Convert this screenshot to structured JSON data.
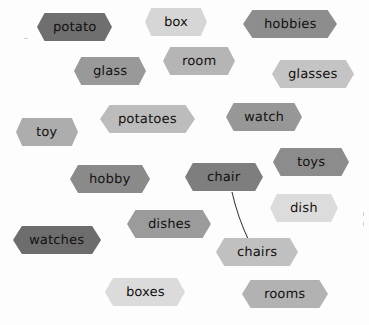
{
  "diagram": {
    "type": "node-graph",
    "title": "",
    "background_color": "#fdfdfd",
    "node_shape": "hexagon",
    "nodes": [
      {
        "id": "potato",
        "label": "potato",
        "color": "#6f6f6f",
        "x": 37,
        "y": 13,
        "w": 75,
        "h": 28
      },
      {
        "id": "box",
        "label": "box",
        "color": "#d6d6d6",
        "x": 145,
        "y": 8,
        "w": 62,
        "h": 28
      },
      {
        "id": "hobbies",
        "label": "hobbies",
        "color": "#8d8d8d",
        "x": 243,
        "y": 10,
        "w": 94,
        "h": 28
      },
      {
        "id": "glass",
        "label": "glass",
        "color": "#999999",
        "x": 74,
        "y": 57,
        "w": 72,
        "h": 28
      },
      {
        "id": "room",
        "label": "room",
        "color": "#b5b5b5",
        "x": 163,
        "y": 47,
        "w": 72,
        "h": 28
      },
      {
        "id": "glasses",
        "label": "glasses",
        "color": "#c4c4c4",
        "x": 272,
        "y": 60,
        "w": 82,
        "h": 28
      },
      {
        "id": "potatoes",
        "label": "potatoes",
        "color": "#bcbcbc",
        "x": 100,
        "y": 105,
        "w": 95,
        "h": 28
      },
      {
        "id": "watch",
        "label": "watch",
        "color": "#979797",
        "x": 226,
        "y": 103,
        "w": 76,
        "h": 28
      },
      {
        "id": "toy",
        "label": "toy",
        "color": "#adadad",
        "x": 16,
        "y": 118,
        "w": 62,
        "h": 28
      },
      {
        "id": "toys",
        "label": "toys",
        "color": "#8c8c8c",
        "x": 273,
        "y": 148,
        "w": 76,
        "h": 28
      },
      {
        "id": "hobby",
        "label": "hobby",
        "color": "#8a8a8a",
        "x": 70,
        "y": 165,
        "w": 80,
        "h": 28
      },
      {
        "id": "chair",
        "label": "chair",
        "color": "#7e7e7e",
        "x": 185,
        "y": 163,
        "w": 78,
        "h": 28
      },
      {
        "id": "dish",
        "label": "dish",
        "color": "#dcdcdc",
        "x": 270,
        "y": 194,
        "w": 68,
        "h": 28
      },
      {
        "id": "dishes",
        "label": "dishes",
        "color": "#9b9b9b",
        "x": 127,
        "y": 210,
        "w": 84,
        "h": 28
      },
      {
        "id": "watches",
        "label": "watches",
        "color": "#6d6d6d",
        "x": 13,
        "y": 226,
        "w": 88,
        "h": 28
      },
      {
        "id": "chairs",
        "label": "chairs",
        "color": "#c0c0c0",
        "x": 216,
        "y": 238,
        "w": 82,
        "h": 28
      },
      {
        "id": "boxes",
        "label": "boxes",
        "color": "#dbdbdb",
        "x": 105,
        "y": 278,
        "w": 80,
        "h": 28
      },
      {
        "id": "rooms",
        "label": "rooms",
        "color": "#b2b2b2",
        "x": 242,
        "y": 280,
        "w": 86,
        "h": 28
      }
    ],
    "edges": [
      {
        "id": "chair-chairs",
        "from": "chair",
        "to": "chairs",
        "color": "#3a3a3a",
        "style": "curved-line"
      }
    ]
  }
}
